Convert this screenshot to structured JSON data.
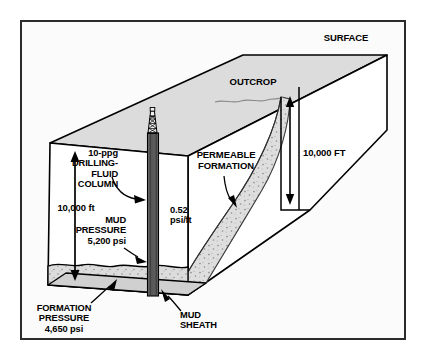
{
  "figure": {
    "title_visible": false,
    "type": "3d-block-diagram"
  },
  "labels": {
    "surface": "SURFACE",
    "outcrop": "OUTCROP",
    "permeable_formation": "PERMEABLE\nFORMATION",
    "right_depth": "10,000 FT",
    "left_depth": "10,000 ft",
    "fluid_column": "10-ppg\nDRILLING-\nFLUID\nCOLUMN",
    "gradient": "0.52\npsi/ft",
    "mud_pressure": "MUD\nPRESSURE\n5,200 psi",
    "formation_pressure": "FORMATION\nPRESSURE\n4,650 psi",
    "mud_sheath": "MUD\nSHEATH"
  },
  "values": {
    "mud_weight_ppg": "10-ppg",
    "mud_gradient_psi_per_ft": "0.52",
    "mud_pressure_psi": "5,200",
    "formation_pressure_psi": "4,650",
    "depth_left_ft": "10,000",
    "depth_right_ft": "10,000"
  },
  "colors": {
    "frame_border": "#2b2b2b",
    "page_background": "#ffffff",
    "panel_background": "#fbfbfb",
    "top_face": "#dcdcdc",
    "side_face": "#ffffff",
    "sediment_fill": "#d9d9d9",
    "permeable_fill": "#d5d5d5",
    "borehole_fill": "#5a5a5a",
    "line": "#000000"
  },
  "icons": {
    "derrick": "drilling-derrick-icon",
    "arrow_up_down": "depth-arrow-icon",
    "pointer": "leader-arrow-icon"
  }
}
